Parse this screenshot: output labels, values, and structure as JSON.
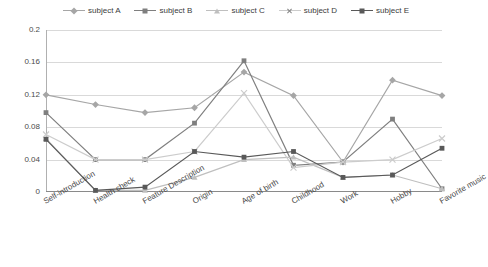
{
  "chart_data": {
    "type": "line",
    "title": "",
    "xlabel": "",
    "ylabel": "",
    "ylim": [
      0,
      0.2
    ],
    "yticks": [
      "0",
      "0.04",
      "0.08",
      "0.12",
      "0.16",
      "0.2"
    ],
    "grid": true,
    "legend_position": "top-center",
    "categories": [
      "Self-introduction",
      "Health check",
      "Feature Description",
      "Origin",
      "Age of birth",
      "Childhood",
      "Work",
      "Hobby",
      "Favorite music"
    ],
    "series": [
      {
        "name": "subject A",
        "marker": "diamond",
        "color": "#a6a6a6",
        "values": [
          0.12,
          0.108,
          0.098,
          0.104,
          0.148,
          0.119,
          0.037,
          0.138,
          0.119
        ]
      },
      {
        "name": "subject B",
        "marker": "square",
        "color": "#7f7f7f",
        "values": [
          0.098,
          0.04,
          0.04,
          0.085,
          0.162,
          0.033,
          0.037,
          0.09,
          0.004
        ]
      },
      {
        "name": "subject C",
        "marker": "triangle",
        "color": "#bfbfbf",
        "values": [
          0.066,
          0.002,
          0.002,
          0.018,
          0.04,
          0.043,
          0.018,
          0.021,
          0.004
        ]
      },
      {
        "name": "subject D",
        "marker": "x",
        "color": "#cccccc",
        "values": [
          0.071,
          0.04,
          0.04,
          0.05,
          0.122,
          0.03,
          0.037,
          0.04,
          0.066
        ]
      },
      {
        "name": "subject E",
        "marker": "square-dark",
        "color": "#595959",
        "values": [
          0.065,
          0.002,
          0.006,
          0.05,
          0.043,
          0.05,
          0.018,
          0.021,
          0.054
        ]
      }
    ]
  }
}
